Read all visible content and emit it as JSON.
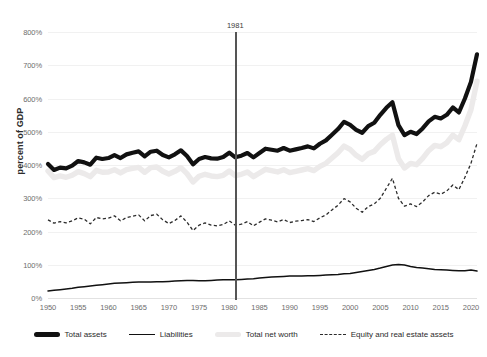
{
  "chart_data": {
    "type": "line",
    "title": "",
    "xlabel": "",
    "ylabel": "percent of GDP",
    "xlim": [
      1950,
      2021
    ],
    "ylim": [
      0,
      800
    ],
    "grid": true,
    "legend_position": "bottom",
    "y_ticks": [
      "0%",
      "100%",
      "200%",
      "300%",
      "400%",
      "500%",
      "600%",
      "700%",
      "800%"
    ],
    "y_tick_values": [
      0,
      100,
      200,
      300,
      400,
      500,
      600,
      700,
      800
    ],
    "x_ticks": [
      "1950",
      "1955",
      "1960",
      "1965",
      "1970",
      "1975",
      "1980",
      "1985",
      "1990",
      "1995",
      "2000",
      "2005",
      "2010",
      "2015",
      "2020"
    ],
    "x_tick_values": [
      1950,
      1955,
      1960,
      1965,
      1970,
      1975,
      1980,
      1985,
      1990,
      1995,
      2000,
      2005,
      2010,
      2015,
      2020
    ],
    "annotations": [
      {
        "label": "1981",
        "type": "vertical-line",
        "x": 1981
      }
    ],
    "x": [
      1950,
      1951,
      1952,
      1953,
      1954,
      1955,
      1956,
      1957,
      1958,
      1959,
      1960,
      1961,
      1962,
      1963,
      1964,
      1965,
      1966,
      1967,
      1968,
      1969,
      1970,
      1971,
      1972,
      1973,
      1974,
      1975,
      1976,
      1977,
      1978,
      1979,
      1980,
      1981,
      1982,
      1983,
      1984,
      1985,
      1986,
      1987,
      1988,
      1989,
      1990,
      1991,
      1992,
      1993,
      1994,
      1995,
      1996,
      1997,
      1998,
      1999,
      2000,
      2001,
      2002,
      2003,
      2004,
      2005,
      2006,
      2007,
      2008,
      2009,
      2010,
      2011,
      2012,
      2013,
      2014,
      2015,
      2016,
      2017,
      2018,
      2019,
      2020,
      2021
    ],
    "series": [
      {
        "name": "Total assets",
        "style": "thick-solid",
        "color": "#111111",
        "values": [
          403,
          385,
          392,
          390,
          398,
          412,
          408,
          401,
          422,
          418,
          421,
          430,
          421,
          432,
          437,
          441,
          426,
          440,
          443,
          430,
          423,
          432,
          444,
          427,
          402,
          418,
          424,
          420,
          419,
          424,
          437,
          423,
          428,
          436,
          423,
          436,
          449,
          446,
          443,
          451,
          443,
          447,
          451,
          456,
          450,
          464,
          474,
          491,
          508,
          530,
          521,
          506,
          497,
          517,
          527,
          551,
          572,
          589,
          520,
          490,
          500,
          493,
          510,
          531,
          545,
          540,
          551,
          573,
          558,
          600,
          650,
          733
        ]
      },
      {
        "name": "Liabilities",
        "style": "thin-solid",
        "color": "#111111",
        "values": [
          21,
          23,
          25,
          27,
          29,
          32,
          34,
          36,
          38,
          40,
          42,
          44,
          45,
          46,
          47,
          48,
          48,
          48,
          49,
          49,
          50,
          51,
          52,
          53,
          53,
          52,
          52,
          53,
          54,
          55,
          55,
          55,
          56,
          57,
          58,
          60,
          62,
          63,
          64,
          65,
          66,
          66,
          66,
          67,
          67,
          68,
          69,
          70,
          71,
          73,
          74,
          77,
          80,
          83,
          86,
          90,
          95,
          99,
          101,
          99,
          95,
          92,
          90,
          88,
          86,
          85,
          84,
          83,
          82,
          82,
          84,
          81
        ]
      },
      {
        "name": "Total net worth",
        "style": "thick-gray",
        "color": "#eceaea",
        "values": [
          382,
          362,
          367,
          363,
          369,
          380,
          374,
          365,
          384,
          378,
          379,
          386,
          376,
          386,
          390,
          393,
          378,
          392,
          394,
          381,
          373,
          381,
          392,
          374,
          349,
          366,
          372,
          367,
          365,
          369,
          382,
          368,
          372,
          379,
          365,
          376,
          387,
          383,
          379,
          386,
          377,
          381,
          385,
          389,
          383,
          396,
          405,
          421,
          437,
          457,
          447,
          429,
          417,
          434,
          441,
          461,
          477,
          490,
          419,
          391,
          405,
          401,
          420,
          443,
          459,
          455,
          467,
          490,
          476,
          518,
          566,
          652
        ]
      },
      {
        "name": "Equity and real estate assets",
        "style": "dashed",
        "color": "#2b2b2b",
        "values": [
          235,
          225,
          230,
          226,
          232,
          241,
          237,
          223,
          242,
          238,
          240,
          247,
          232,
          242,
          246,
          250,
          232,
          248,
          252,
          235,
          224,
          233,
          247,
          228,
          203,
          219,
          226,
          219,
          217,
          221,
          232,
          219,
          222,
          230,
          217,
          228,
          238,
          234,
          229,
          236,
          227,
          231,
          233,
          236,
          230,
          241,
          250,
          265,
          279,
          299,
          289,
          270,
          258,
          275,
          283,
          300,
          330,
          360,
          300,
          276,
          283,
          275,
          289,
          308,
          318,
          312,
          322,
          340,
          326,
          363,
          405,
          465
        ]
      }
    ]
  },
  "axis": {
    "y_title": "percent of GDP"
  },
  "legend": {
    "items": [
      {
        "label": "Total assets",
        "marker": "thick-line-swatch"
      },
      {
        "label": "Liabilities",
        "marker": "thin-line-swatch"
      },
      {
        "label": "Total net worth",
        "marker": "gray-line-swatch"
      },
      {
        "label": "Equity and real estate assets",
        "marker": "dashed-line-swatch"
      }
    ]
  },
  "colors": {
    "total_assets": "#111111",
    "liabilities": "#111111",
    "total_net_worth": "#eceaea",
    "equity_real_estate": "#2b2b2b",
    "annotation_line": "#555555",
    "gridline": "#f1f1f1",
    "background": "#ffffff"
  }
}
